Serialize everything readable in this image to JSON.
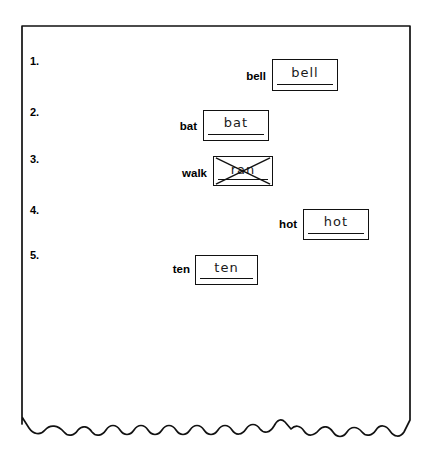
{
  "page": {
    "type": "spelling-worksheet",
    "background_color": "#ffffff",
    "ink_color": "#111111",
    "paper_edge": "torn-bottom-edge"
  },
  "rows": [
    {
      "number": "1.",
      "prompt": "bell",
      "answer": "bell",
      "crossed_out": false,
      "number_top": 55,
      "prompt_right": 266,
      "prompt_top": 70,
      "box_left": 272,
      "box_top": 59,
      "box_width": 66,
      "box_height": 32
    },
    {
      "number": "2.",
      "prompt": "bat",
      "answer": "bat",
      "crossed_out": false,
      "number_top": 106,
      "prompt_right": 197,
      "prompt_top": 120,
      "box_left": 203,
      "box_top": 110,
      "box_width": 66,
      "box_height": 31
    },
    {
      "number": "3.",
      "prompt": "walk",
      "answer": "ran",
      "crossed_out": true,
      "number_top": 153,
      "prompt_right": 207,
      "prompt_top": 167,
      "box_left": 213,
      "box_top": 156,
      "box_width": 60,
      "box_height": 30
    },
    {
      "number": "4.",
      "prompt": "hot",
      "answer": "hot",
      "crossed_out": false,
      "number_top": 204,
      "prompt_right": 297,
      "prompt_top": 218,
      "box_left": 303,
      "box_top": 209,
      "box_width": 66,
      "box_height": 31
    },
    {
      "number": "5.",
      "prompt": "ten",
      "answer": "ten",
      "crossed_out": false,
      "number_top": 249,
      "prompt_right": 190,
      "prompt_top": 263,
      "box_left": 195,
      "box_top": 255,
      "box_width": 63,
      "box_height": 30
    }
  ]
}
